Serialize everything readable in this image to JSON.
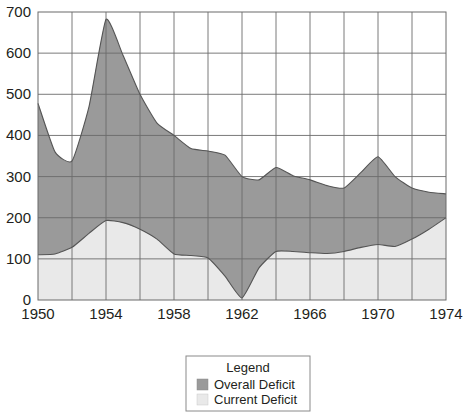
{
  "chart_data": {
    "type": "area",
    "title": "",
    "subtitle": "",
    "xlabel": "",
    "ylabel": "",
    "xlim": [
      1950,
      1974
    ],
    "ylim": [
      0,
      700
    ],
    "grid": true,
    "stacked": false,
    "legend_position": "bottom-center",
    "legend_title": "Legend",
    "x_ticks": [
      1950,
      1954,
      1958,
      1962,
      1966,
      1970,
      1974
    ],
    "x_tick_labels": [
      "1950",
      "1954",
      "1958",
      "1962",
      "1966",
      "1970",
      "1974"
    ],
    "x_gridlines": [
      1952,
      1954,
      1956,
      1958,
      1960,
      1962,
      1964,
      1966,
      1968,
      1970,
      1972
    ],
    "y_ticks": [
      0,
      100,
      200,
      300,
      400,
      500,
      600,
      700
    ],
    "y_tick_labels": [
      "0",
      "100",
      "200",
      "300",
      "400",
      "500",
      "600",
      "700"
    ],
    "x": [
      1950,
      1951,
      1952,
      1953,
      1954,
      1955,
      1956,
      1957,
      1958,
      1959,
      1960,
      1961,
      1962,
      1963,
      1964,
      1965,
      1966,
      1967,
      1968,
      1969,
      1970,
      1971,
      1972,
      1973,
      1974
    ],
    "series": [
      {
        "name": "Overall Deficit",
        "color": "#9a9a9a",
        "values": [
          478,
          360,
          338,
          470,
          682,
          595,
          500,
          430,
          400,
          368,
          362,
          352,
          300,
          292,
          322,
          302,
          292,
          278,
          272,
          310,
          348,
          300,
          272,
          262,
          258
        ]
      },
      {
        "name": "Current Deficit",
        "color": "#e9e9e9",
        "values": [
          110,
          112,
          128,
          162,
          193,
          188,
          172,
          148,
          112,
          108,
          102,
          58,
          5,
          78,
          118,
          118,
          115,
          113,
          118,
          128,
          135,
          130,
          148,
          172,
          200
        ]
      }
    ]
  },
  "legend": {
    "title": "Legend",
    "items": [
      {
        "label": "Overall Deficit",
        "color": "#9a9a9a",
        "swatch_name": "legend-swatch-overall-deficit"
      },
      {
        "label": "Current Deficit",
        "color": "#e9e9e9",
        "swatch_name": "legend-swatch-current-deficit"
      }
    ]
  },
  "colors": {
    "overall_deficit": "#9a9a9a",
    "current_deficit": "#e9e9e9",
    "axis": "#6b6b6b",
    "gridline": "#6b6b6b",
    "curve": "#555555",
    "legend_border": "#8a8a8a",
    "text": "#231f20",
    "background": "#ffffff"
  }
}
